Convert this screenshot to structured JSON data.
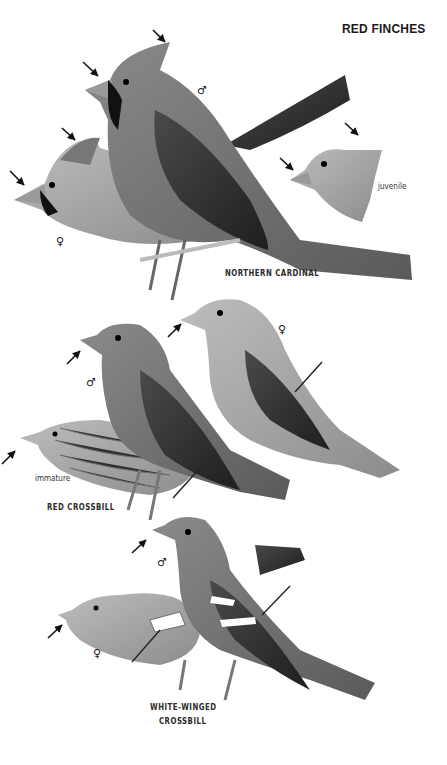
{
  "page": {
    "title": "RED FINCHES",
    "colors": {
      "background": "#ffffff",
      "ink": "#1a1a1a"
    }
  },
  "species": [
    {
      "name": "NORTHERN CARDINAL",
      "figures": [
        {
          "label": "♂",
          "role": "male"
        },
        {
          "label": "♀",
          "role": "female"
        },
        {
          "label": "juvenile",
          "role": "juvenile"
        }
      ]
    },
    {
      "name": "RED CROSSBILL",
      "figures": [
        {
          "label": "♂",
          "role": "male"
        },
        {
          "label": "♀",
          "role": "female"
        },
        {
          "label": "immature",
          "role": "immature"
        }
      ]
    },
    {
      "name_line1": "WHITE-WINGED",
      "name_line2": "CROSSBILL",
      "figures": [
        {
          "label": "♂",
          "role": "male"
        },
        {
          "label": "♀",
          "role": "female"
        }
      ]
    }
  ],
  "icons": [
    "pointer-arrow",
    "male-symbol",
    "female-symbol"
  ]
}
